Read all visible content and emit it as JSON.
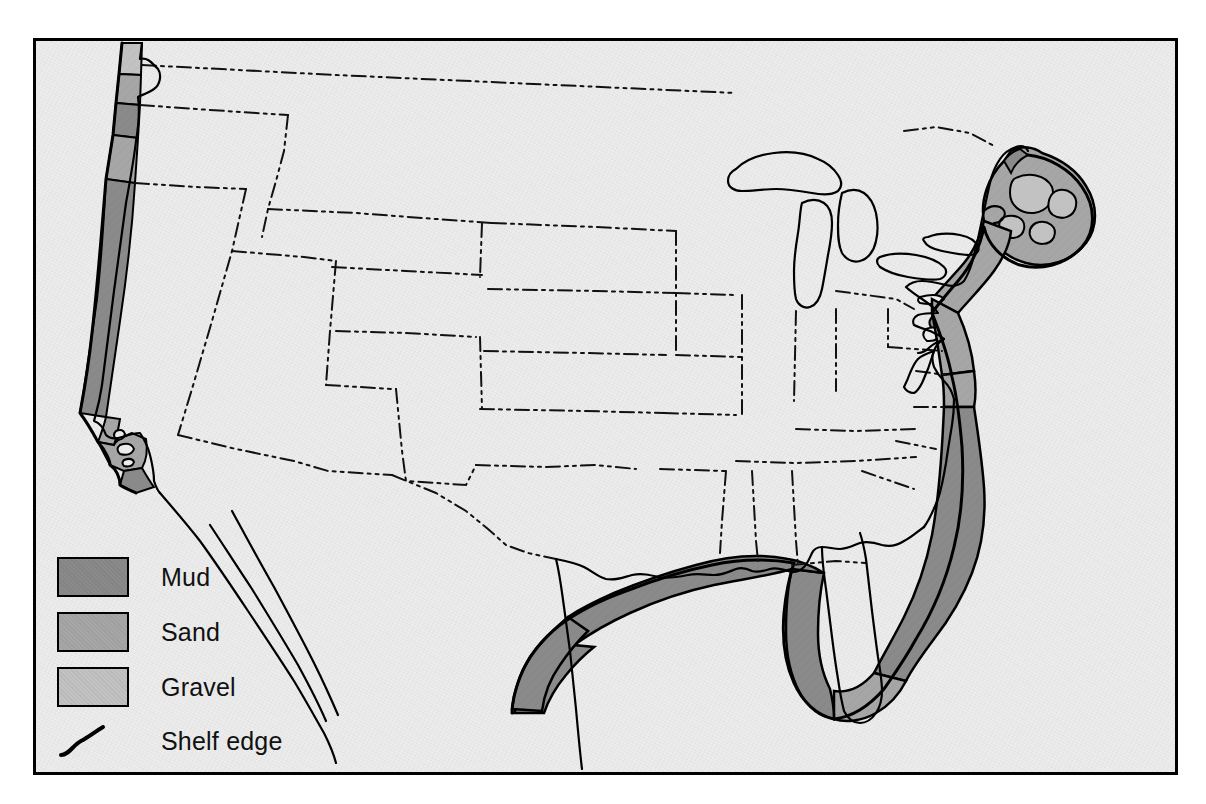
{
  "map": {
    "title": "Continental shelf sediment distribution of the United States",
    "region": "United States (conterminous)",
    "background_color": "#ececec",
    "frame_color": "#000000",
    "coast_line_color": "#000000",
    "state_border_style": "dash-dot-dot",
    "sediment_colors": {
      "mud": "#8a8a8a",
      "sand": "#a6a6a6",
      "gravel": "#c2c2c2"
    }
  },
  "legend": {
    "items": [
      {
        "key": "mud",
        "label": "Mud",
        "swatch_class": "mud",
        "color": "#8a8a8a"
      },
      {
        "key": "sand",
        "label": "Sand",
        "swatch_class": "sand",
        "color": "#a6a6a6"
      },
      {
        "key": "gravel",
        "label": "Gravel",
        "swatch_class": "gravel",
        "color": "#c2c2c2"
      }
    ],
    "shelf_edge": {
      "label": "Shelf edge",
      "symbol": "wavy-line",
      "color": "#000000"
    }
  },
  "shelf_regions": [
    {
      "name": "washington-outer-coast",
      "sediment": "gravel"
    },
    {
      "name": "washington-central-coast",
      "sediment": "sand"
    },
    {
      "name": "oregon-north-coast",
      "sediment": "mud"
    },
    {
      "name": "oregon-south-coast",
      "sediment": "sand"
    },
    {
      "name": "northern-california",
      "sediment": "mud"
    },
    {
      "name": "central-california",
      "sediment": "sand"
    },
    {
      "name": "southern-california-bight",
      "sediment": "sand"
    },
    {
      "name": "san-diego-shelf",
      "sediment": "mud"
    },
    {
      "name": "gulf-of-maine",
      "sediment": "sand"
    },
    {
      "name": "georges-bank",
      "sediment": "gravel"
    },
    {
      "name": "southern-new-england",
      "sediment": "sand"
    },
    {
      "name": "middle-atlantic-bight",
      "sediment": "sand"
    },
    {
      "name": "chesapeake-shelf",
      "sediment": "sand"
    },
    {
      "name": "carolina-shelf",
      "sediment": "mud"
    },
    {
      "name": "south-atlantic-bight",
      "sediment": "mud"
    },
    {
      "name": "south-florida-shelf",
      "sediment": "sand"
    },
    {
      "name": "west-florida-shelf",
      "sediment": "mud"
    },
    {
      "name": "northern-gulf-of-mexico",
      "sediment": "mud"
    },
    {
      "name": "texas-shelf",
      "sediment": "mud"
    }
  ]
}
